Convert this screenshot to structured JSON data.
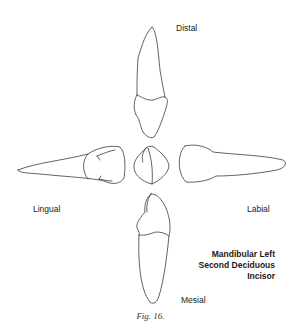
{
  "figure": {
    "caption": "Fig. 16.",
    "title_lines": [
      "Mandibular Left",
      "Second Deciduous",
      "Incisor"
    ],
    "labels": {
      "top": "Distal",
      "left": "Lingual",
      "right": "Labial",
      "bottom": "Mesial"
    },
    "views": [
      {
        "id": "distal-view",
        "position": "top"
      },
      {
        "id": "lingual-view",
        "position": "left"
      },
      {
        "id": "incisal-view",
        "position": "center"
      },
      {
        "id": "labial-view",
        "position": "right"
      },
      {
        "id": "mesial-view",
        "position": "bottom"
      }
    ]
  }
}
